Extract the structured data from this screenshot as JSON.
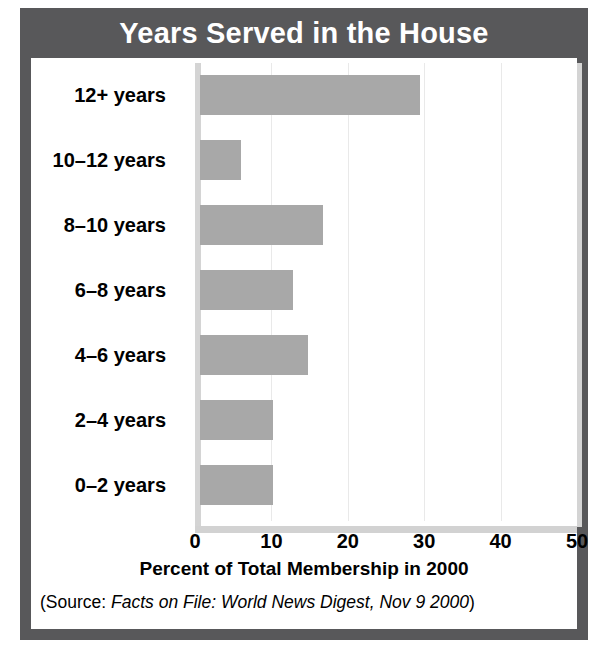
{
  "figure": {
    "title": "Years Served in the House",
    "source_prefix": "(Source: ",
    "source_italic": "Facts on File: World News Digest, Nov 9 2000",
    "source_suffix": ")",
    "colors": {
      "frame": "#58585a",
      "title_text": "#ffffff",
      "bar": "#a8a8a8",
      "gridline": "#e9e9e9",
      "axis": "#d4d4d4",
      "panel": "#ffffff"
    }
  },
  "chart_data": {
    "type": "bar",
    "orientation": "horizontal",
    "title": "Years Served in the House",
    "xlabel": "Percent of Total Membership in 2000",
    "ylabel": "",
    "categories": [
      "0–2 years",
      "2–4 years",
      "4–6 years",
      "6–8 years",
      "8–10 years",
      "10–12 years",
      "12+ years"
    ],
    "values": [
      10.2,
      10.2,
      14.8,
      12.8,
      16.8,
      6.0,
      29.5
    ],
    "xlim": [
      0,
      50
    ],
    "xticks": [
      0,
      10,
      20,
      30,
      40,
      50
    ],
    "xtick_labels": [
      "0",
      "10",
      "20",
      "30",
      "40",
      "50"
    ],
    "grid": "vertical",
    "legend": "none",
    "series": [
      {
        "name": "Percent of Total Membership in 2000",
        "values": [
          10.2,
          10.2,
          14.8,
          12.8,
          16.8,
          6.0,
          29.5
        ]
      }
    ]
  }
}
